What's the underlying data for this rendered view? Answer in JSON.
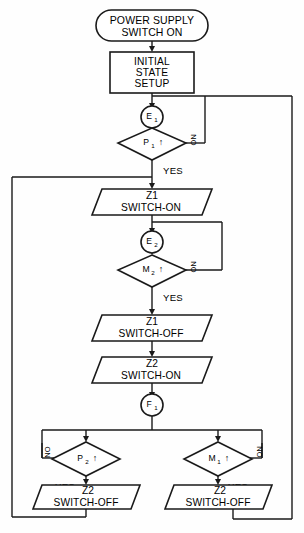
{
  "diagram": {
    "type": "flowchart",
    "background_color": "#fefefe",
    "line_color": "#1a1a1a",
    "text_color": "#000000"
  },
  "nodes": {
    "terminal_start": {
      "shape": "oval",
      "line1": "POWER SUPPLY",
      "line2": "SWITCH ON"
    },
    "process_init": {
      "shape": "rectangle",
      "line1": "INITIAL",
      "line2": "STATE",
      "line3": "SETUP"
    },
    "state_e1": {
      "shape": "circle",
      "label": "E",
      "subscript": "1"
    },
    "decision_p1": {
      "shape": "diamond",
      "label": "P",
      "subscript": "1",
      "glyph": "↑",
      "yes_label": "YES",
      "no_label": "NO"
    },
    "io_z1_on": {
      "shape": "parallelogram",
      "line1": "Z1",
      "line2": "SWITCH-ON"
    },
    "state_e2": {
      "shape": "circle",
      "label": "E",
      "subscript": "2"
    },
    "decision_m2": {
      "shape": "diamond",
      "label": "M",
      "subscript": "2",
      "glyph": "↑",
      "yes_label": "YES",
      "no_label": "NO"
    },
    "io_z1_off": {
      "shape": "parallelogram",
      "line1": "Z1",
      "line2": "SWITCH-OFF"
    },
    "io_z2_on": {
      "shape": "parallelogram",
      "line1": "Z2",
      "line2": "SWITCH-ON"
    },
    "state_f1": {
      "shape": "circle",
      "label": "F",
      "subscript": "1"
    },
    "decision_p2": {
      "shape": "diamond",
      "label": "P",
      "subscript": "2",
      "glyph": "↑",
      "yes_label": "YES",
      "no_label": "NO"
    },
    "decision_m1": {
      "shape": "diamond",
      "label": "M",
      "subscript": "1",
      "glyph": "↑",
      "yes_label": "YES",
      "no_label": "NO"
    },
    "io_z2_off_left": {
      "shape": "parallelogram",
      "line1": "Z2",
      "line2": "SWITCH-OFF"
    },
    "io_z2_off_right": {
      "shape": "parallelogram",
      "line1": "Z2",
      "line2": "SWITCH-OFF"
    }
  }
}
